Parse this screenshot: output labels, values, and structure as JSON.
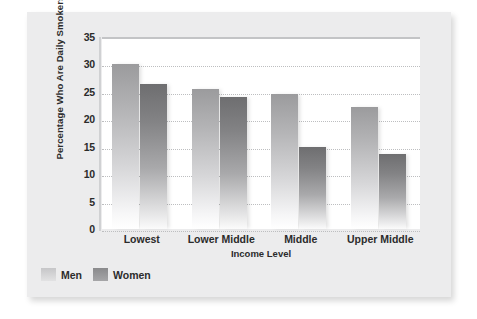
{
  "chart_data": {
    "type": "bar",
    "title": "",
    "subtitle": "",
    "xlabel": "Income Level",
    "ylabel": "Percentage Who Are Daily Smokers",
    "categories": [
      "Lowest",
      "Lower Middle",
      "Middle",
      "Upper Middle"
    ],
    "series": [
      {
        "name": "Men",
        "values": [
          30.0,
          25.5,
          24.7,
          22.3
        ],
        "color": "#b4b4b6"
      },
      {
        "name": "Women",
        "values": [
          26.4,
          24.0,
          15.0,
          13.7
        ],
        "color": "#838385"
      }
    ],
    "ylim": [
      0,
      35
    ],
    "ytick_labels": [
      "0",
      "5",
      "10",
      "15",
      "20",
      "25",
      "30",
      "35"
    ],
    "ytick_values": [
      0,
      5,
      10,
      15,
      20,
      25,
      30,
      35
    ],
    "grid": "horizontal-dotted",
    "legend_position": "bottom-left",
    "legend_entries": [
      "Men",
      "Women"
    ]
  },
  "figure": {
    "panel_color": "#ececed",
    "plot_background": "#ffffff",
    "gridline_color": "#bdbec0",
    "axis_color": "#d0d1d3",
    "text_color": "#2b2b2b"
  }
}
